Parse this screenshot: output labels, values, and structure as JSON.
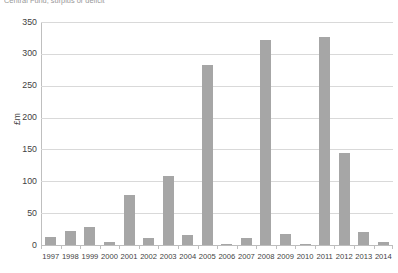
{
  "chart_data": {
    "type": "bar",
    "title": "Central Fund, surplus or deficit",
    "xlabel": "",
    "ylabel": "£m",
    "ylim": [
      0,
      350
    ],
    "ytick_step": 50,
    "yticks": [
      0,
      50,
      100,
      150,
      200,
      250,
      300,
      350
    ],
    "ytick_labels": [
      "0",
      "50",
      "100",
      "150",
      "200",
      "250",
      "300",
      "350"
    ],
    "grid": true,
    "legend": false,
    "bar_color": "#a6a6a6",
    "gridline_color": "#d9d9d9",
    "axis_color": "#bfbfbf",
    "categories": [
      "1997",
      "1998",
      "1999",
      "2000",
      "2001",
      "2002",
      "2003",
      "2004",
      "2005",
      "2006",
      "2007",
      "2008",
      "2009",
      "2010",
      "2011",
      "2012",
      "2013",
      "2014"
    ],
    "values": [
      13,
      22,
      28,
      4,
      78,
      11,
      108,
      15,
      282,
      2,
      11,
      322,
      17,
      2,
      327,
      144,
      21,
      5
    ]
  }
}
